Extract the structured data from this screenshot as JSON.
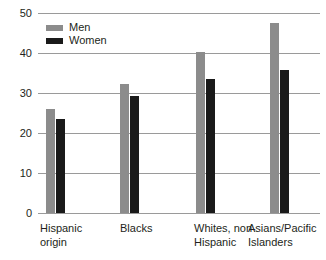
{
  "chart_data": {
    "type": "bar",
    "title": "",
    "subtitle": "",
    "xlabel": "",
    "ylabel": "",
    "categories": [
      "Hispanic\norigin",
      "Blacks",
      "Whites, non-\nHispanic",
      "Asians/Pacific\nIslanders"
    ],
    "series": [
      {
        "name": "Men",
        "values": [
          26.0,
          32.3,
          40.2,
          47.5
        ],
        "color": "#8c8c8c"
      },
      {
        "name": "Women",
        "values": [
          23.4,
          29.3,
          33.5,
          35.7
        ],
        "color": "#1a1a1a"
      }
    ],
    "ylim": [
      0,
      50
    ],
    "yticks": [
      0,
      10,
      20,
      30,
      40,
      50
    ],
    "ytick_labels": [
      "0",
      "10",
      "20",
      "30",
      "40",
      "50"
    ],
    "grid": true,
    "legend_position": "top-left",
    "gridline_color": "#9a9a9a",
    "background_color": "#ffffff",
    "text_color": "#231f20"
  },
  "legend": {
    "entries": [
      {
        "label": "Men",
        "swatch": "legend-swatch-men"
      },
      {
        "label": "Women",
        "swatch": "legend-swatch-women"
      }
    ]
  }
}
